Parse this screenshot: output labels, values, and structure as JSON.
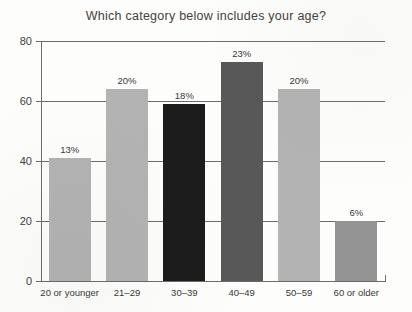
{
  "chart_data": {
    "type": "bar",
    "title": "Which category below includes your age?",
    "xlabel": "",
    "ylabel": "",
    "ylim": [
      0,
      80
    ],
    "yticks": [
      0,
      20,
      40,
      60,
      80
    ],
    "ytick_labels": [
      "0",
      "20",
      "40",
      "60",
      "80"
    ],
    "grid": true,
    "legend": false,
    "categories": [
      "20 or younger",
      "21–29",
      "30–39",
      "40–49",
      "50–59",
      "60 or older"
    ],
    "values": [
      41,
      64,
      59,
      73,
      64,
      20
    ],
    "data_labels": [
      "13%",
      "20%",
      "18%",
      "23%",
      "20%",
      "6%"
    ],
    "bar_colors": [
      "#b3b3b3",
      "#b3b3b3",
      "#1c1c1c",
      "#585858",
      "#b3b3b3",
      "#949494"
    ],
    "axis_color": "#6e6c6a",
    "background_color": "#fdfdfc"
  }
}
